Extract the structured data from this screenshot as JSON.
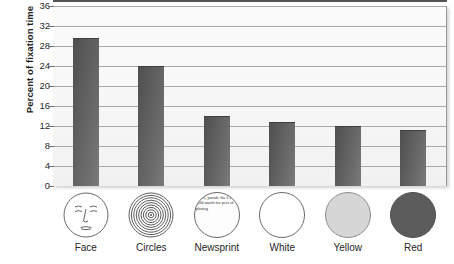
{
  "chart_data": {
    "type": "bar",
    "title": "",
    "xlabel": "",
    "ylabel": "Percent of fixation time",
    "categories": [
      "Face",
      "Circles",
      "Newsprint",
      "White",
      "Yellow",
      "Red"
    ],
    "values": [
      29.5,
      23.8,
      13.8,
      12.6,
      11.9,
      11.0
    ],
    "ylim": [
      0,
      36
    ],
    "yticks": [
      0,
      4,
      8,
      12,
      16,
      20,
      24,
      28,
      32,
      36
    ],
    "ytick_labels": [
      "0",
      "4",
      "8",
      "12",
      "16",
      "20",
      "24",
      "28",
      "32",
      "36"
    ],
    "grid": true,
    "legend": "none",
    "bar_color": "#5d5d5d",
    "plot_background": "#f6f6f6"
  },
  "icons": [
    {
      "name": "face-icon",
      "label": "Face",
      "kind": "face",
      "fill": "#ffffff"
    },
    {
      "name": "concentric-circles-icon",
      "label": "Circles",
      "kind": "rings",
      "fill": "#ffffff"
    },
    {
      "name": "newsprint-icon",
      "label": "Newsprint",
      "kind": "newsprint",
      "fill": "#fdfdfd",
      "text": "llows, parade the Court, hold much for pers of photog"
    },
    {
      "name": "white-disc-icon",
      "label": "White",
      "kind": "disc",
      "fill": "#ffffff"
    },
    {
      "name": "yellow-disc-icon",
      "label": "Yellow",
      "kind": "disc",
      "fill": "#d6d6d6"
    },
    {
      "name": "red-disc-icon",
      "label": "Red",
      "kind": "disc",
      "fill": "#5c5c5c"
    }
  ]
}
